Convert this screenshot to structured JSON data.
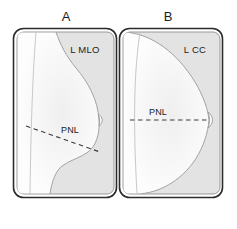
{
  "figure": {
    "background_color": "#ffffff",
    "panels": [
      {
        "letter": "A",
        "view_label": "L MLO",
        "measurement_label": "PNL",
        "line_type": "dashed-oblique",
        "description": "Left mediolateral oblique mammographic view with posterior nipple line drawn obliquely from the pectoral muscle edge to the nipple"
      },
      {
        "letter": "B",
        "view_label": "L CC",
        "measurement_label": "PNL",
        "line_type": "dashed-horizontal",
        "description": "Left craniocaudal mammographic view with posterior nipple line drawn horizontally from the chest wall edge to the nipple"
      }
    ],
    "colors": {
      "outline": "#2b2b2b",
      "panel_fill": "#e3e3e3",
      "breast_fill": "#fdfdfd",
      "soft_outline": "#b9b9b9",
      "dashed_line": "#3a3a3a",
      "text": "#1b1b1b"
    }
  }
}
